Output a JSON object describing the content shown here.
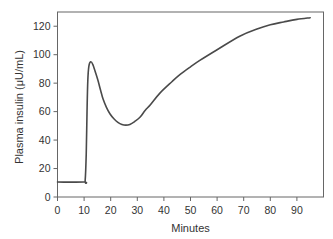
{
  "chart_data": {
    "type": "line",
    "title": "",
    "xlabel": "Minutes",
    "ylabel": "Plasma insulin (μU/mL)",
    "xlim": [
      0,
      100
    ],
    "ylim": [
      0,
      130
    ],
    "x_ticks": [
      0,
      10,
      20,
      30,
      40,
      50,
      60,
      70,
      80,
      90
    ],
    "y_ticks": [
      0,
      20,
      40,
      60,
      80,
      100,
      120
    ],
    "grid": false,
    "legend": null,
    "series": [
      {
        "name": "Plasma insulin",
        "color": "#4a4a4a",
        "x": [
          0,
          10,
          10.4,
          10.8,
          11.1,
          11.4,
          11.8,
          12.5,
          13.3,
          14.2,
          15.2,
          16.2,
          17.1,
          18.4,
          19.7,
          21.2,
          22.7,
          24.2,
          25.7,
          27.2,
          29,
          31,
          33,
          35,
          38.5,
          43,
          46,
          50,
          53.5,
          60,
          68.5,
          75,
          80,
          85,
          90,
          95
        ],
        "y": [
          10.5,
          10.5,
          11.5,
          30,
          60,
          82,
          92,
          95,
          93,
          88,
          82,
          75,
          69,
          63,
          58.5,
          55,
          52.5,
          51,
          50.5,
          51,
          53,
          56,
          61,
          65,
          73,
          81,
          86,
          91.5,
          96,
          103.5,
          113,
          118,
          121,
          123,
          124.8,
          126
        ]
      }
    ]
  },
  "colors": {
    "axis": "#555555",
    "line": "#4a4a4a",
    "text": "#333333"
  }
}
